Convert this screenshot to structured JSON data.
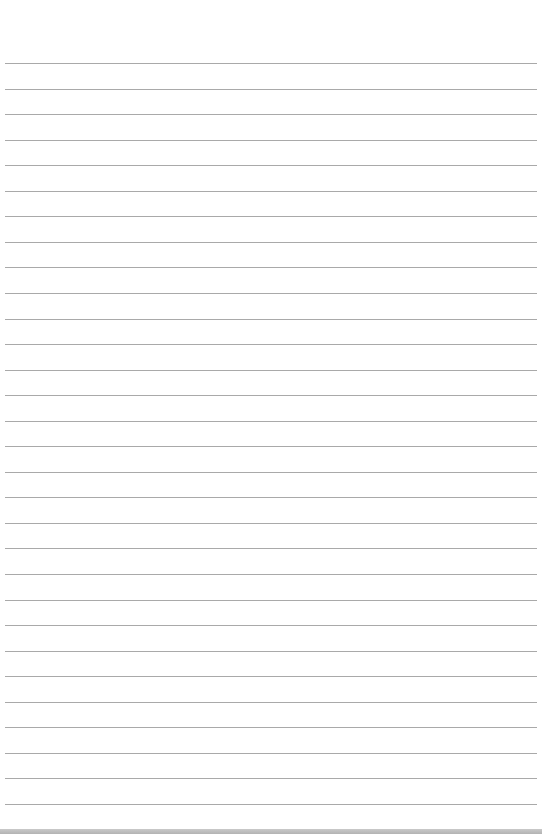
{
  "paper": {
    "type": "lined-paper",
    "background_color": "#ffffff",
    "line_color": "#a9a9a9",
    "line_count": 30,
    "first_line_y": 63,
    "line_spacing": 25.55,
    "edge_color": "#bdbdbd"
  }
}
